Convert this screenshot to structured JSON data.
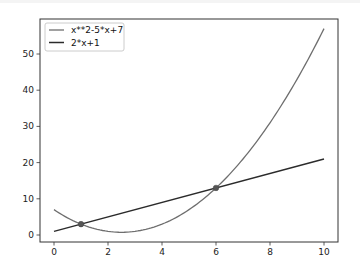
{
  "chart_data": {
    "type": "line",
    "title": "",
    "xlabel": "",
    "ylabel": "",
    "xlim": [
      -0.5,
      10.5
    ],
    "ylim": [
      -2,
      60
    ],
    "x_ticks": [
      0,
      2,
      4,
      6,
      8,
      10
    ],
    "x_tick_labels": [
      "0",
      "2",
      "4",
      "6",
      "8",
      "10"
    ],
    "y_ticks": [
      0,
      10,
      20,
      30,
      40,
      50
    ],
    "y_tick_labels": [
      "0",
      "10",
      "20",
      "30",
      "40",
      "50"
    ],
    "grid": false,
    "legend_position": "top-left",
    "series": [
      {
        "name": "x**2-5*x+7",
        "color": "#6e6e6e",
        "x": [
          0,
          0.5,
          1,
          1.5,
          2,
          2.5,
          3,
          3.5,
          4,
          4.5,
          5,
          5.5,
          6,
          6.5,
          7,
          7.5,
          8,
          8.5,
          9,
          9.5,
          10
        ],
        "values": [
          7,
          4.75,
          3,
          1.75,
          1,
          0.75,
          1,
          1.75,
          3,
          4.75,
          7,
          9.75,
          13,
          16.75,
          21,
          25.75,
          31,
          36.75,
          43,
          49.75,
          57
        ]
      },
      {
        "name": "2*x+1",
        "color": "#2b2b2b",
        "x": [
          0,
          10
        ],
        "values": [
          1,
          21
        ]
      }
    ],
    "markers": [
      {
        "label": "intersection",
        "x": 1,
        "y": 3
      },
      {
        "label": "intersection",
        "x": 6,
        "y": 13
      }
    ]
  }
}
